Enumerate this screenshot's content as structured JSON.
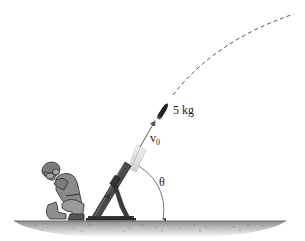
{
  "figure": {
    "type": "physics-diagram",
    "labels": {
      "mass": "5 kg",
      "velocity_symbol": "v",
      "velocity_subscript": "0",
      "angle": "θ"
    },
    "elements": [
      "kneeling-soldier",
      "mortar-tube",
      "projectile",
      "initial-velocity-arrow",
      "dashed-trajectory",
      "angle-arc",
      "ground"
    ],
    "colors": {
      "line": "#555555",
      "mortar": "#3a3a3a",
      "soldier_fill": "#8a8a8a",
      "soldier_outline": "#2a2a2a",
      "ground_top": "#9a9a9a",
      "ground_bottom": "#ffffff",
      "projectile": "#222222"
    }
  }
}
